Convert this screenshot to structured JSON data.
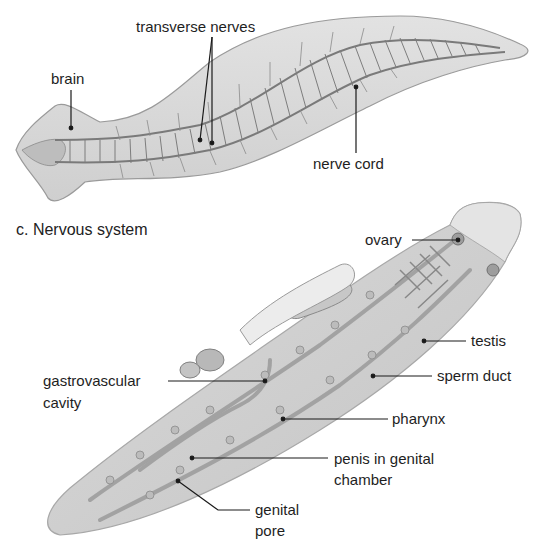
{
  "figure": {
    "part_c": {
      "caption": "c. Nervous system",
      "labels": {
        "brain": "brain",
        "transverse_nerves": "transverse nerves",
        "nerve_cord": "nerve cord"
      }
    },
    "part_d": {
      "labels": {
        "ovary": "ovary",
        "testis": "testis",
        "sperm_duct": "sperm duct",
        "gastrovascular_cavity_line1": "gastrovascular",
        "gastrovascular_cavity_line2": "cavity",
        "pharynx": "pharynx",
        "penis_line1": "penis in genital",
        "penis_line2": "chamber",
        "genital_pore_line1": "genital",
        "genital_pore_line2": "pore"
      }
    },
    "colors": {
      "body_fill": "#d6d6d6",
      "outline": "#8a8a8a",
      "nerve": "#6e6e6e",
      "leader": "#1a1a1a"
    }
  }
}
